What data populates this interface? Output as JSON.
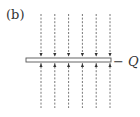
{
  "figure": {
    "panel_label": "(b)",
    "charge_label": "− Q",
    "field_line_count": 6,
    "field_direction": "toward plate",
    "line_style": "dashed",
    "colors": {
      "line": "#555555",
      "plate_stroke": "#555555",
      "plate_fill": "#ffffff",
      "text": "#333333"
    }
  }
}
